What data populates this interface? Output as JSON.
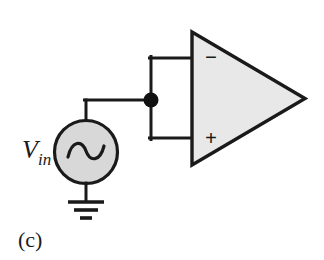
{
  "figure": {
    "caption": "(c)",
    "background_color": "#ffffff",
    "line_color": "#1a1a1a"
  },
  "source": {
    "label_main": "V",
    "label_sub": "in",
    "symbol": "sine-wave",
    "fill_color": "#d8d8d8",
    "outline_color": "#1a1a1a"
  },
  "ground": {
    "symbol": "earth-ground"
  },
  "opamp": {
    "name": "operational-amplifier",
    "inverting_input_label": "−",
    "noninverting_input_label": "+",
    "fill_color": "#e8e8e8",
    "outline_color": "#1a1a1a"
  },
  "junction": {
    "symbol": "connection-dot",
    "color": "#111111"
  }
}
